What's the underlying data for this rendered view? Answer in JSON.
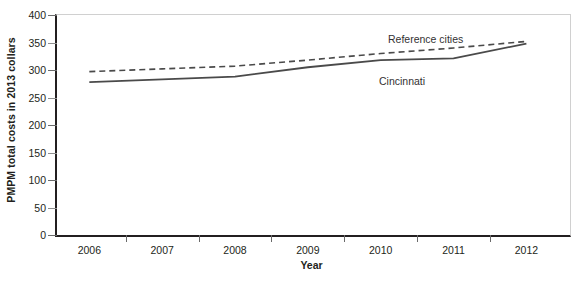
{
  "chart_data": {
    "type": "line",
    "title": "",
    "xlabel": "Year",
    "ylabel": "PMPM total costs in 2013 collars",
    "x": [
      2006,
      2007,
      2008,
      2009,
      2010,
      2011,
      2012
    ],
    "xticklabels": [
      "2006",
      "2007",
      "2008",
      "2009",
      "2010",
      "2011",
      "2012"
    ],
    "yticklabels": [
      "0",
      "50",
      "100",
      "150",
      "200",
      "250",
      "300",
      "350",
      "400"
    ],
    "yticks": [
      0,
      50,
      100,
      150,
      200,
      250,
      300,
      350,
      400
    ],
    "ylim": [
      0,
      400
    ],
    "xlim": [
      2006,
      2012
    ],
    "grid": false,
    "legend_position": "inline-annotation",
    "series": [
      {
        "name": "Reference cities",
        "style": "dashed",
        "color": "#4a4a4a",
        "values": [
          297,
          302,
          307,
          318,
          330,
          340,
          352
        ]
      },
      {
        "name": "Cincinnati",
        "style": "solid",
        "color": "#4a4a4a",
        "values": [
          278,
          283,
          288,
          305,
          318,
          321,
          348
        ]
      }
    ],
    "annotations": [
      {
        "text": "Reference cities",
        "series": "Reference cities"
      },
      {
        "text": "Cincinnati",
        "series": "Cincinnati"
      }
    ]
  }
}
